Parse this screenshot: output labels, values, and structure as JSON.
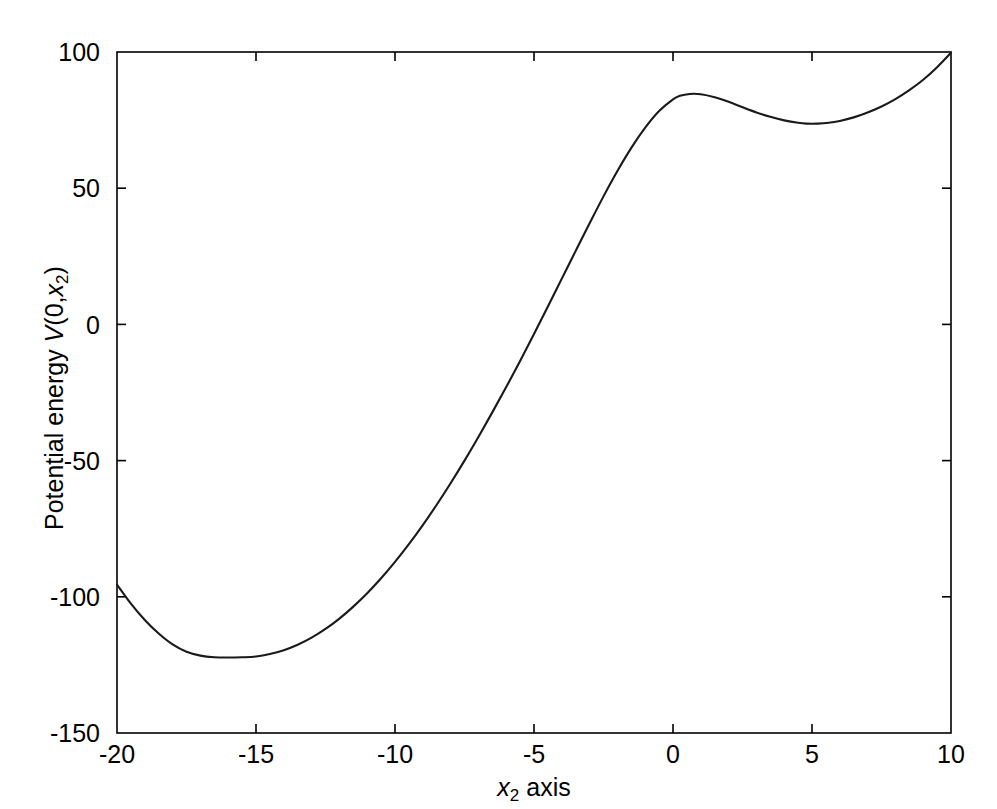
{
  "figure": {
    "background_color": "#ffffff",
    "line_color": "#1a1a1a",
    "axis_color": "#000000"
  },
  "axes": {
    "y_title_prefix": "Potential energy ",
    "y_title_v": "V",
    "y_title_args": "(0,",
    "y_title_var": "x",
    "y_title_sub": "2",
    "y_title_close": ")",
    "x_title_var": "x",
    "x_title_sub": "2",
    "x_title_rest": " axis",
    "x_ticks": [
      "-20",
      "-15",
      "-10",
      "-5",
      "0",
      "5",
      "10"
    ],
    "y_ticks": [
      "100",
      "50",
      "0",
      "-50",
      "-100",
      "-150"
    ]
  },
  "chart_data": {
    "type": "line",
    "title": "",
    "xlabel": "x2 axis",
    "ylabel": "Potential energy V(0,x2)",
    "xlim": [
      -20,
      10
    ],
    "ylim": [
      -150,
      100
    ],
    "xticks": [
      -20,
      -15,
      -10,
      -5,
      0,
      5,
      10
    ],
    "yticks": [
      -150,
      -100,
      -50,
      0,
      50,
      100
    ],
    "grid": false,
    "legend": false,
    "series": [
      {
        "name": "V(0,x2)",
        "color": "#1a1a1a",
        "x": [
          -20,
          -19.5,
          -19,
          -18.5,
          -18,
          -17.5,
          -17,
          -16.5,
          -16,
          -15.5,
          -15,
          -14.5,
          -14,
          -13.5,
          -13,
          -12.5,
          -12,
          -11.5,
          -11,
          -10.5,
          -10,
          -9.5,
          -9,
          -8.5,
          -8,
          -7.5,
          -7,
          -6.5,
          -6,
          -5.5,
          -5,
          -4.5,
          -4,
          -3.5,
          -3,
          -2.5,
          -2,
          -1.5,
          -1,
          -0.5,
          0,
          0.25,
          0.6,
          1,
          1.5,
          2,
          2.5,
          3,
          3.5,
          4,
          4.5,
          4.8,
          5.2,
          5.6,
          6,
          6.5,
          7,
          7.5,
          8,
          8.5,
          9,
          9.5,
          10
        ],
        "y": [
          -95.5,
          -102.5,
          -108.5,
          -113.5,
          -117.5,
          -120.2,
          -121.6,
          -122.2,
          -122.3,
          -122.2,
          -121.9,
          -121.0,
          -119.6,
          -117.6,
          -115.0,
          -111.8,
          -108.0,
          -103.6,
          -98.7,
          -93.2,
          -87.2,
          -80.7,
          -73.7,
          -66.2,
          -58.3,
          -50.0,
          -41.3,
          -32.3,
          -23.0,
          -13.4,
          -3.5,
          6.6,
          16.8,
          27.0,
          37.1,
          47.0,
          56.3,
          64.8,
          72.2,
          78.3,
          82.6,
          83.9,
          84.6,
          84.5,
          83.4,
          81.7,
          79.7,
          77.8,
          76.2,
          74.9,
          74.0,
          73.7,
          73.7,
          74.0,
          74.7,
          76.0,
          77.8,
          80.0,
          82.7,
          86.0,
          89.8,
          94.4,
          99.7
        ]
      }
    ],
    "annotations": {
      "global_minimum": {
        "x": -15.0,
        "y": -122.3
      },
      "local_maximum": {
        "x": 0.6,
        "y": 84.6
      },
      "local_minimum": {
        "x": 4.9,
        "y": 73.7
      },
      "left_endpoint": {
        "x": -20,
        "y": -95.5
      },
      "right_endpoint": {
        "x": 10,
        "y": 99.7
      },
      "zero_crossing_x": -3.8
    }
  }
}
